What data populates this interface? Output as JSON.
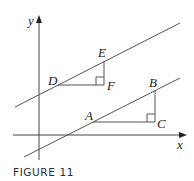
{
  "figure": {
    "caption": "FIGURE 11",
    "axes": {
      "x_label": "x",
      "y_label": "y"
    },
    "points": {
      "A": "A",
      "B": "B",
      "C": "C",
      "D": "D",
      "E": "E",
      "F": "F"
    },
    "colors": {
      "line": "#555555",
      "axis": "#444444",
      "text": "#1a1a1a"
    }
  }
}
